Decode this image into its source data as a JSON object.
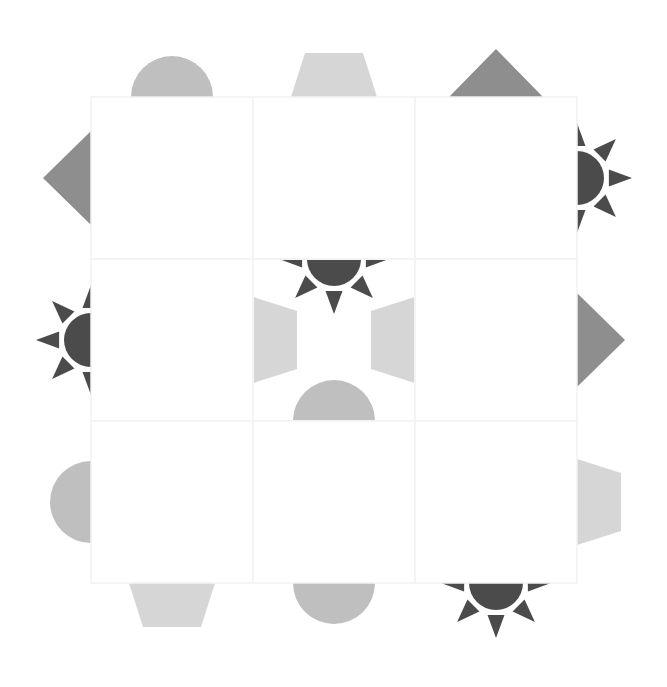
{
  "game": {
    "title": "Edge matching tile puzzle",
    "grid": {
      "rows": 3,
      "cols": 3
    },
    "colors": {
      "sun": "#4b4b4b",
      "triangle": "#8e8e8e",
      "semicircle": "#bfbfbf",
      "trapezoid": "#d6d6d6",
      "grid_line": "#f2f2f2",
      "background": "#ffffff"
    },
    "tiles": [
      {
        "row": 0,
        "col": 0,
        "edges": {
          "top": "semicircle",
          "left": "triangle"
        }
      },
      {
        "row": 0,
        "col": 1,
        "edges": {
          "top": "trapezoid"
        }
      },
      {
        "row": 0,
        "col": 2,
        "edges": {
          "top": "triangle",
          "right": "sun"
        }
      },
      {
        "row": 1,
        "col": 0,
        "edges": {
          "left": "sun"
        }
      },
      {
        "row": 1,
        "col": 1,
        "edges": {
          "top": "sun",
          "left": "trapezoid",
          "right": "trapezoid",
          "bottom": "semicircle"
        }
      },
      {
        "row": 1,
        "col": 2,
        "edges": {
          "right": "triangle"
        }
      },
      {
        "row": 2,
        "col": 0,
        "edges": {
          "left": "semicircle",
          "bottom": "trapezoid"
        }
      },
      {
        "row": 2,
        "col": 1,
        "edges": {
          "bottom": "semicircle"
        }
      },
      {
        "row": 2,
        "col": 2,
        "edges": {
          "right": "trapezoid",
          "bottom": "sun"
        }
      }
    ]
  }
}
